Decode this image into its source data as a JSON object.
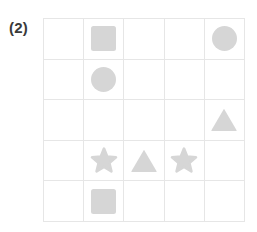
{
  "figure": {
    "label": "(2)",
    "grid": {
      "rows": 5,
      "columns": 5,
      "line_color": "#e6e6e6",
      "shape_color": "#d6d6d6",
      "background_color": "#ffffff"
    },
    "cells": [
      {
        "row": 1,
        "col": 1,
        "shape": "empty"
      },
      {
        "row": 1,
        "col": 2,
        "shape": "square"
      },
      {
        "row": 1,
        "col": 3,
        "shape": "empty"
      },
      {
        "row": 1,
        "col": 4,
        "shape": "empty"
      },
      {
        "row": 1,
        "col": 5,
        "shape": "circle"
      },
      {
        "row": 2,
        "col": 1,
        "shape": "empty"
      },
      {
        "row": 2,
        "col": 2,
        "shape": "circle"
      },
      {
        "row": 2,
        "col": 3,
        "shape": "empty"
      },
      {
        "row": 2,
        "col": 4,
        "shape": "empty"
      },
      {
        "row": 2,
        "col": 5,
        "shape": "empty"
      },
      {
        "row": 3,
        "col": 1,
        "shape": "empty"
      },
      {
        "row": 3,
        "col": 2,
        "shape": "empty"
      },
      {
        "row": 3,
        "col": 3,
        "shape": "empty"
      },
      {
        "row": 3,
        "col": 4,
        "shape": "empty"
      },
      {
        "row": 3,
        "col": 5,
        "shape": "triangle"
      },
      {
        "row": 4,
        "col": 1,
        "shape": "empty"
      },
      {
        "row": 4,
        "col": 2,
        "shape": "star"
      },
      {
        "row": 4,
        "col": 3,
        "shape": "triangle"
      },
      {
        "row": 4,
        "col": 4,
        "shape": "star"
      },
      {
        "row": 4,
        "col": 5,
        "shape": "empty"
      },
      {
        "row": 5,
        "col": 1,
        "shape": "empty"
      },
      {
        "row": 5,
        "col": 2,
        "shape": "square"
      },
      {
        "row": 5,
        "col": 3,
        "shape": "empty"
      },
      {
        "row": 5,
        "col": 4,
        "shape": "empty"
      },
      {
        "row": 5,
        "col": 5,
        "shape": "empty"
      }
    ]
  }
}
